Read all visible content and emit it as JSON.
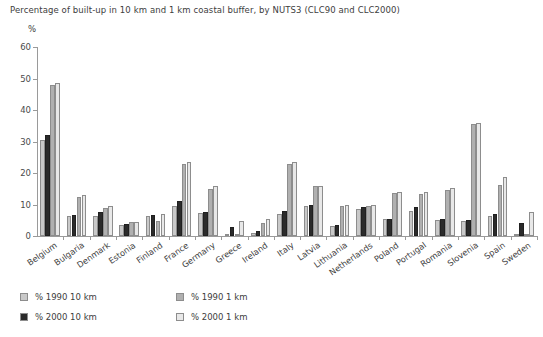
{
  "chart_data": {
    "type": "bar",
    "title": "Percentage of built-up in 10 km and 1 km coastal buffer, by NUTS3 (CLC90 and CLC2000)",
    "ylabel": "%",
    "xlabel": "",
    "ylim": [
      0,
      60
    ],
    "yticks": [
      0,
      10,
      20,
      30,
      40,
      50,
      60
    ],
    "grid": false,
    "legend_position": "bottom-left",
    "categories": [
      "Belgium",
      "Bulgaria",
      "Denmark",
      "Estonia",
      "Finland",
      "France",
      "Germany",
      "Greece",
      "Ireland",
      "Italy",
      "Latvia",
      "Lithuania",
      "Netherlands",
      "Poland",
      "Portugal",
      "Romania",
      "Slovenia",
      "Spain",
      "Sweden"
    ],
    "series": [
      {
        "name": "% 1990 10 km",
        "color": "#c9c9c9",
        "values": [
          30.5,
          6.5,
          6.5,
          3.6,
          6.2,
          9.5,
          7.4,
          0.4,
          1.1,
          7.0,
          9.5,
          3.2,
          8.5,
          5.3,
          7.8,
          5.1,
          4.8,
          6.5,
          0.5
        ]
      },
      {
        "name": "% 2000 10 km",
        "color": "#2b2b2b",
        "values": [
          32.0,
          6.6,
          7.6,
          3.8,
          6.7,
          11.0,
          7.6,
          2.9,
          1.6,
          8.1,
          10.0,
          3.4,
          9.2,
          5.5,
          9.2,
          5.4,
          5.0,
          7.0,
          4.0
        ]
      },
      {
        "name": "% 1990 1 km",
        "color": "#b0b0b0",
        "values": [
          48.0,
          12.4,
          9.0,
          4.4,
          4.7,
          23.0,
          15.0,
          0.5,
          4.2,
          23.0,
          16.0,
          9.6,
          9.4,
          13.6,
          13.2,
          14.6,
          35.6,
          16.2,
          0.7
        ]
      },
      {
        "name": "% 2000 1 km",
        "color": "#e8e8e8",
        "values": [
          48.6,
          13.0,
          9.5,
          4.4,
          7.0,
          23.4,
          16.0,
          4.8,
          5.4,
          23.4,
          16.0,
          10.0,
          10.0,
          14.0,
          14.0,
          15.1,
          35.8,
          18.8,
          7.6
        ]
      }
    ]
  }
}
